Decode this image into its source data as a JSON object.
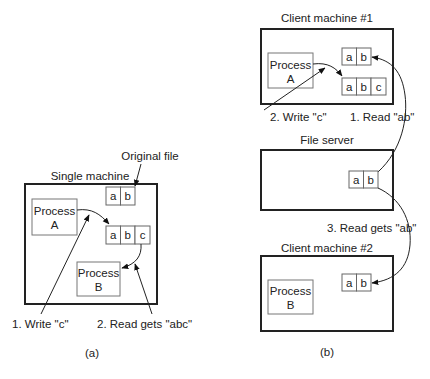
{
  "panel_a": {
    "caption": "(a)",
    "machine_label": "Single machine",
    "original_file_label": "Original file",
    "original_file_cells": [
      "a",
      "b"
    ],
    "modified_file_cells": [
      "a",
      "b",
      "c"
    ],
    "process_a": {
      "line1": "Process",
      "line2": "A"
    },
    "process_b": {
      "line1": "Process",
      "line2": "B"
    },
    "step1": "1. Write \"c\"",
    "step2": "2. Read gets \"abc\""
  },
  "panel_b": {
    "caption": "(b)",
    "client1": {
      "label": "Client machine #1",
      "cached_cells": [
        "a",
        "b"
      ],
      "modified_cells": [
        "a",
        "b",
        "c"
      ],
      "process": {
        "line1": "Process",
        "line2": "A"
      }
    },
    "file_server": {
      "label": "File server",
      "file_cells": [
        "a",
        "b"
      ]
    },
    "client2": {
      "label": "Client machine #2",
      "cached_cells": [
        "a",
        "b"
      ],
      "process": {
        "line1": "Process",
        "line2": "B"
      }
    },
    "step1": "1. Read \"ab\"",
    "step2": "2. Write \"c\"",
    "step3": "3. Read gets \"ab\""
  },
  "colors": {
    "stroke": "#222222",
    "box_stroke": "#777777",
    "background": "#ffffff"
  }
}
